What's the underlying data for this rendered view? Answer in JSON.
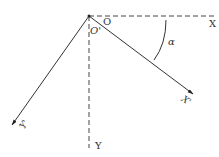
{
  "diagram": {
    "type": "coordinate-rotation",
    "labels": {
      "origin": "O",
      "origin_prime": "O'",
      "x_axis": "X",
      "y_axis": "Y",
      "x_prime_axis": "X'",
      "y_prime_axis": "Y'",
      "angle": "α"
    },
    "colors": {
      "line": "#333333",
      "dashed": "#444444",
      "background": "#ffffff"
    }
  }
}
